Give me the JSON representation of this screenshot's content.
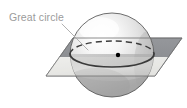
{
  "figure": {
    "kind": "geometry-diagram",
    "background_color": "#ffffff",
    "width": 187,
    "height": 108
  },
  "labels": {
    "great_circle": "Great circle"
  },
  "colors": {
    "label_text": "#9b9b9b",
    "leader_line": "#a8a8a8",
    "sphere_outline": "#4a4a4a",
    "sphere_light": "#fdfdfd",
    "sphere_mid": "#d9d9d9",
    "sphere_shadow": "#9a9a9a",
    "plane_back": "#8e9094",
    "plane_front": "#e9e9e7",
    "plane_outline": "#6e6e6e",
    "great_circle_stroke": "#3c3c3c",
    "center_dot": "#000000"
  },
  "geometry": {
    "sphere": {
      "center_x": 112,
      "center_y": 55,
      "radius": 42
    },
    "great_circle_ellipse": {
      "center_x": 112,
      "center_y": 54,
      "radius_x": 42,
      "radius_y": 13,
      "front_arc_style": "solid",
      "back_arc_style": "dashed"
    },
    "center_point": {
      "x": 118,
      "y": 55,
      "radius": 2.2
    },
    "plane": {
      "shape": "parallelogram",
      "points": "73,38 182,38 155,76 46,76"
    },
    "leader_line": {
      "from_x": 62,
      "from_y": 24,
      "to_x": 88,
      "to_y": 50
    },
    "label_position": {
      "x": 9,
      "y": 21
    }
  }
}
